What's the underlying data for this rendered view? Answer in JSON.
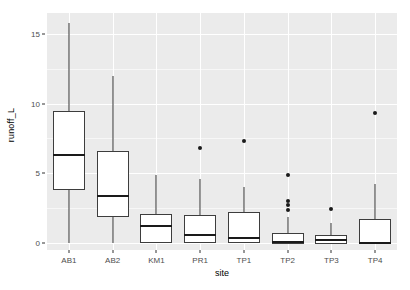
{
  "chart_data": {
    "type": "boxplot",
    "title": "",
    "xlabel": "site",
    "ylabel": "runoff_L",
    "categories": [
      "AB1",
      "AB2",
      "KM1",
      "PR1",
      "TP1",
      "TP2",
      "TP3",
      "TP4"
    ],
    "ylim": [
      -0.5,
      16.5
    ],
    "yticks": [
      0,
      5,
      10,
      15
    ],
    "ytick_labels": [
      "0",
      "5",
      "10",
      "15"
    ],
    "grid": "major-and-minor-white-on-gray",
    "legend": "none",
    "theme": "ggplot2 theme_gray",
    "boxes": [
      {
        "site": "AB1",
        "whisker_low": 0.0,
        "q1": 3.8,
        "median": 6.3,
        "q3": 9.5,
        "whisker_high": 15.8,
        "outliers": []
      },
      {
        "site": "AB2",
        "whisker_low": 0.0,
        "q1": 1.9,
        "median": 3.4,
        "q3": 6.6,
        "whisker_high": 12.0,
        "outliers": []
      },
      {
        "site": "KM1",
        "whisker_low": 0.0,
        "q1": 0.0,
        "median": 1.25,
        "q3": 2.1,
        "whisker_high": 4.85,
        "outliers": []
      },
      {
        "site": "PR1",
        "whisker_low": 0.0,
        "q1": 0.0,
        "median": 0.6,
        "q3": 2.0,
        "whisker_high": 4.6,
        "outliers": [
          6.8
        ]
      },
      {
        "site": "TP1",
        "whisker_low": 0.0,
        "q1": 0.0,
        "median": 0.35,
        "q3": 2.2,
        "whisker_high": 4.0,
        "outliers": [
          7.3
        ]
      },
      {
        "site": "TP2",
        "whisker_low": -0.05,
        "q1": -0.05,
        "median": 0.1,
        "q3": 0.7,
        "whisker_high": 1.9,
        "outliers": [
          4.9,
          3.0,
          2.75,
          2.4
        ]
      },
      {
        "site": "TP3",
        "whisker_low": -0.05,
        "q1": -0.05,
        "median": 0.2,
        "q3": 0.55,
        "whisker_high": 1.45,
        "outliers": [
          2.45
        ]
      },
      {
        "site": "TP4",
        "whisker_low": 0.0,
        "q1": 0.0,
        "median": 0.0,
        "q3": 1.7,
        "whisker_high": 4.25,
        "outliers": [
          9.3
        ]
      }
    ]
  },
  "colors": {
    "panel_background": "#ebebeb",
    "grid_major": "#ffffff",
    "grid_minor": "#f7f7f7",
    "box_fill": "#ffffff",
    "box_stroke": "#3d3d3d",
    "median_stroke": "#1a1a1a",
    "outlier_fill": "#1a1a1a",
    "axis_text": "#4d4d4d",
    "axis_title": "#000000",
    "plot_background": "#ffffff"
  }
}
